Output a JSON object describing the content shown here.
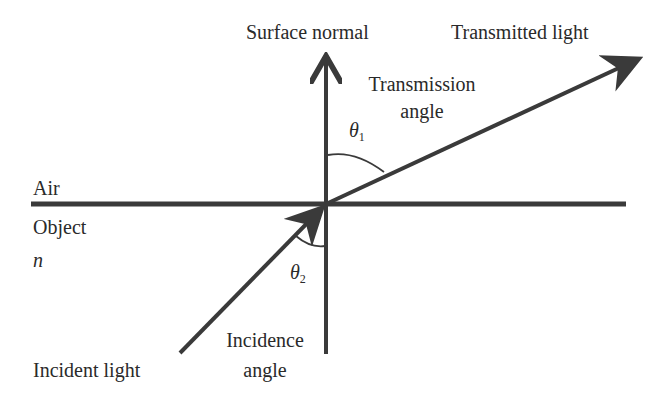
{
  "diagram": {
    "labels": {
      "surface_normal": "Surface normal",
      "transmitted_light": "Transmitted light",
      "transmission_angle_line1": "Transmission",
      "transmission_angle_line2": "angle",
      "theta1": "θ",
      "theta1_sub": "1",
      "air": "Air",
      "object": "Object",
      "n": "n",
      "theta2": "θ",
      "theta2_sub": "2",
      "incidence_angle_line1": "Incidence",
      "incidence_angle_line2": "angle",
      "incident_light": "Incident light"
    },
    "colors": {
      "line": "#3a3a3a",
      "text": "#2a2a2a",
      "background": "#ffffff"
    }
  }
}
